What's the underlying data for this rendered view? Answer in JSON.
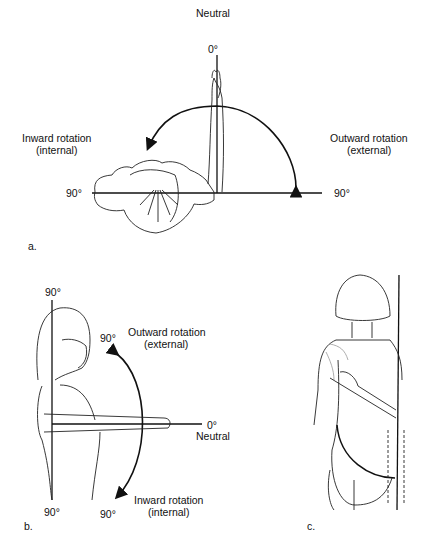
{
  "panels": [
    {
      "id": "a",
      "label": "a.",
      "top_label": "Neutral",
      "zero": "0°",
      "left_title": "Inward rotation",
      "left_sub": "(internal)",
      "right_title": "Outward rotation",
      "right_sub": "(external)",
      "left_deg": "90°",
      "right_deg": "90°"
    },
    {
      "id": "b",
      "label": "b.",
      "top_deg": "90°",
      "bottom_deg": "90°",
      "arc_top_deg": "90°",
      "arc_bottom_deg": "90°",
      "outward_title": "Outward rotation",
      "outward_sub": "(external)",
      "inward_title": "Inward rotation",
      "inward_sub": "(internal)",
      "zero": "0°",
      "neutral": "Neutral"
    },
    {
      "id": "c",
      "label": "c."
    }
  ]
}
